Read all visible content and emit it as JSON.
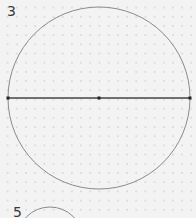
{
  "problems": [
    {
      "number": "3",
      "figure": "circle-with-diameter",
      "center": [
        99,
        98
      ],
      "radius": 91,
      "diameter_endpoints": [
        [
          8,
          98
        ],
        [
          190,
          98
        ]
      ]
    },
    {
      "number": "5",
      "figure": "circle-partial",
      "center": [
        50,
        240
      ],
      "radius": 33
    }
  ],
  "colors": {
    "background": "#f3f3f3",
    "dots": "#dcdcdc",
    "circle_stroke": "#8a8a8a",
    "diameter_stroke": "#444444",
    "point": "#222222"
  }
}
